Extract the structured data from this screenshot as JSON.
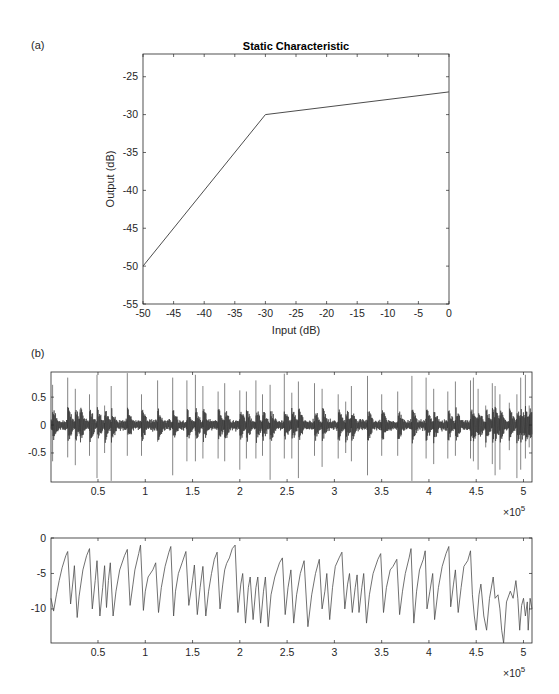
{
  "figure": {
    "panel_a_label": "(a)",
    "panel_b_label": "(b)",
    "axis_color": "#262626",
    "line_color": "#4d4d4d",
    "waveform_color": "#333333"
  },
  "chart_data": [
    {
      "id": "static-characteristic",
      "type": "line",
      "title": "Static Characteristic",
      "xlabel": "Input (dB)",
      "ylabel": "Output (dB)",
      "xlim": [
        -50,
        0
      ],
      "ylim": [
        -55,
        -22
      ],
      "xticks": [
        -50,
        -45,
        -40,
        -35,
        -30,
        -25,
        -20,
        -15,
        -10,
        -5,
        0
      ],
      "yticks": [
        -55,
        -50,
        -45,
        -40,
        -35,
        -30,
        -25
      ],
      "grid": false,
      "legend": null,
      "series": [
        {
          "name": "static characteristic",
          "x": [
            -50,
            -30,
            0
          ],
          "y": [
            -50,
            -30,
            -27
          ]
        }
      ],
      "annotations": [
        "knee at input -30 dB (slope 1 below, slope 0.1 above)"
      ]
    },
    {
      "id": "input-signal",
      "type": "line",
      "title": "",
      "xlabel": "",
      "ylabel": "",
      "x_multiplier": "×10^5",
      "xlim": [
        0.003,
        5.09
      ],
      "ylim": [
        -1.02,
        0.95
      ],
      "xticks": [
        0.5,
        1,
        1.5,
        2,
        2.5,
        3,
        3.5,
        4,
        4.5,
        5
      ],
      "yticks": [
        -0.5,
        0,
        0.5
      ],
      "grid": false,
      "description": "Percussive audio waveform, noise floor ~±0.1 with periodic transient spikes",
      "noise_amplitude": 0.1,
      "spikes": [
        {
          "x": 0.02,
          "up": 0.72,
          "down": -0.65
        },
        {
          "x": 0.18,
          "up": 0.85,
          "down": -0.58
        },
        {
          "x": 0.26,
          "up": 0.65,
          "down": -0.72
        },
        {
          "x": 0.31,
          "up": 0.28,
          "down": -0.2
        },
        {
          "x": 0.41,
          "up": 0.55,
          "down": -0.55
        },
        {
          "x": 0.49,
          "up": 0.9,
          "down": -0.95
        },
        {
          "x": 0.57,
          "up": 0.35,
          "down": -0.5
        },
        {
          "x": 0.64,
          "up": 0.7,
          "down": -1.0
        },
        {
          "x": 0.81,
          "up": 0.93,
          "down": -0.55
        },
        {
          "x": 0.96,
          "up": 0.55,
          "down": -0.55
        },
        {
          "x": 1.13,
          "up": 0.8,
          "down": -0.3
        },
        {
          "x": 1.29,
          "up": 0.85,
          "down": -0.9
        },
        {
          "x": 1.44,
          "up": 0.8,
          "down": -0.65
        },
        {
          "x": 1.53,
          "up": 0.9,
          "down": -0.65
        },
        {
          "x": 1.61,
          "up": 0.7,
          "down": -0.6
        },
        {
          "x": 1.77,
          "up": 0.6,
          "down": -0.6
        },
        {
          "x": 1.84,
          "up": 0.75,
          "down": -0.65
        },
        {
          "x": 2.0,
          "up": 0.62,
          "down": -0.8
        },
        {
          "x": 2.07,
          "up": 0.6,
          "down": -0.6
        },
        {
          "x": 2.17,
          "up": 0.8,
          "down": -0.6
        },
        {
          "x": 2.24,
          "up": 0.55,
          "down": -0.55
        },
        {
          "x": 2.32,
          "up": 0.72,
          "down": -0.98
        },
        {
          "x": 2.47,
          "up": 0.92,
          "down": -0.6
        },
        {
          "x": 2.55,
          "up": 0.58,
          "down": -0.6
        },
        {
          "x": 2.62,
          "up": 0.78,
          "down": -0.95
        },
        {
          "x": 2.79,
          "up": 0.75,
          "down": -0.55
        },
        {
          "x": 2.87,
          "up": 0.65,
          "down": -0.75
        },
        {
          "x": 3.04,
          "up": 0.55,
          "down": -0.6
        },
        {
          "x": 3.12,
          "up": 0.42,
          "down": -0.5
        },
        {
          "x": 3.18,
          "up": 0.7,
          "down": -0.65
        },
        {
          "x": 3.35,
          "up": 0.88,
          "down": -0.9
        },
        {
          "x": 3.5,
          "up": 0.55,
          "down": -0.55
        },
        {
          "x": 3.67,
          "up": 0.6,
          "down": -0.55
        },
        {
          "x": 3.82,
          "up": 0.88,
          "down": -1.0
        },
        {
          "x": 3.97,
          "up": 0.85,
          "down": -0.6
        },
        {
          "x": 4.05,
          "up": 0.65,
          "down": -0.7
        },
        {
          "x": 4.2,
          "up": 0.6,
          "down": -0.6
        },
        {
          "x": 4.28,
          "up": 0.78,
          "down": -0.55
        },
        {
          "x": 4.44,
          "up": 0.8,
          "down": -0.6
        },
        {
          "x": 4.47,
          "up": 0.85,
          "down": -0.65
        },
        {
          "x": 4.52,
          "up": 0.65,
          "down": -0.8
        },
        {
          "x": 4.6,
          "up": 0.35,
          "down": -0.4
        },
        {
          "x": 4.67,
          "up": 0.75,
          "down": -0.7
        },
        {
          "x": 4.7,
          "up": 0.7,
          "down": -0.9
        },
        {
          "x": 4.75,
          "up": 0.55,
          "down": -0.8
        },
        {
          "x": 4.85,
          "up": 0.4,
          "down": -0.45
        },
        {
          "x": 4.93,
          "up": 0.55,
          "down": -0.95
        },
        {
          "x": 4.97,
          "up": 0.85,
          "down": -0.8
        },
        {
          "x": 5.02,
          "up": 0.9,
          "down": -0.6
        },
        {
          "x": 5.06,
          "up": 0.35,
          "down": -0.4
        }
      ]
    },
    {
      "id": "gain-signal",
      "type": "line",
      "title": "",
      "xlabel": "",
      "ylabel": "",
      "x_multiplier": "×10^5",
      "xlim": [
        0.003,
        5.09
      ],
      "ylim": [
        -14.8,
        0
      ],
      "xticks": [
        0.5,
        1,
        1.5,
        2,
        2.5,
        3,
        3.5,
        4,
        4.5,
        5
      ],
      "yticks": [
        -10,
        -5,
        0
      ],
      "grid": false,
      "description": "Sawtooth-like gain trace: sharp drops at transients then gradual recovery",
      "points": [
        [
          0.003,
          -8.5
        ],
        [
          0.03,
          -10.3
        ],
        [
          0.06,
          -8
        ],
        [
          0.09,
          -6
        ],
        [
          0.12,
          -4.2
        ],
        [
          0.16,
          -2.5
        ],
        [
          0.18,
          -1.9
        ],
        [
          0.21,
          -9.3
        ],
        [
          0.24,
          -5.5
        ],
        [
          0.25,
          -3.9
        ],
        [
          0.28,
          -11.2
        ],
        [
          0.3,
          -8.2
        ],
        [
          0.34,
          -4.5
        ],
        [
          0.38,
          -2.5
        ],
        [
          0.41,
          -1.5
        ],
        [
          0.44,
          -10
        ],
        [
          0.47,
          -6
        ],
        [
          0.49,
          -3.2
        ],
        [
          0.52,
          -11
        ],
        [
          0.55,
          -7
        ],
        [
          0.57,
          -3.9
        ],
        [
          0.59,
          -9.8
        ],
        [
          0.61,
          -6
        ],
        [
          0.63,
          -3.5
        ],
        [
          0.66,
          -11
        ],
        [
          0.69,
          -7.5
        ],
        [
          0.73,
          -4.5
        ],
        [
          0.78,
          -2.5
        ],
        [
          0.81,
          -1.6
        ],
        [
          0.84,
          -9.5
        ],
        [
          0.87,
          -6.5
        ],
        [
          0.89,
          -4.5
        ],
        [
          0.93,
          -2.2
        ],
        [
          0.95,
          -1
        ],
        [
          0.98,
          -10.2
        ],
        [
          1.0,
          -7.5
        ],
        [
          1.03,
          -5.5
        ],
        [
          1.08,
          -4.5
        ],
        [
          1.11,
          -3.5
        ],
        [
          1.14,
          -10.5
        ],
        [
          1.17,
          -7
        ],
        [
          1.21,
          -4
        ],
        [
          1.25,
          -2
        ],
        [
          1.27,
          -1.2
        ],
        [
          1.3,
          -11
        ],
        [
          1.32,
          -7.5
        ],
        [
          1.35,
          -5
        ],
        [
          1.39,
          -3.5
        ],
        [
          1.43,
          -1.9
        ],
        [
          1.46,
          -9.5
        ],
        [
          1.5,
          -6
        ],
        [
          1.52,
          -3.8
        ],
        [
          1.55,
          -10.8
        ],
        [
          1.58,
          -7
        ],
        [
          1.61,
          -4
        ],
        [
          1.64,
          -11
        ],
        [
          1.67,
          -7.5
        ],
        [
          1.7,
          -5
        ],
        [
          1.73,
          -3
        ],
        [
          1.76,
          -2
        ],
        [
          1.79,
          -10
        ],
        [
          1.82,
          -6.5
        ],
        [
          1.84,
          -4.5
        ],
        [
          1.86,
          -3.6
        ],
        [
          1.89,
          -2.8
        ],
        [
          1.92,
          -1.5
        ],
        [
          1.95,
          -1
        ],
        [
          1.98,
          -10.5
        ],
        [
          2.01,
          -6.5
        ],
        [
          2.03,
          -5
        ],
        [
          2.06,
          -12
        ],
        [
          2.09,
          -7
        ],
        [
          2.11,
          -5.5
        ],
        [
          2.14,
          -11.5
        ],
        [
          2.17,
          -7
        ],
        [
          2.19,
          -5.5
        ],
        [
          2.22,
          -12
        ],
        [
          2.25,
          -7.5
        ],
        [
          2.27,
          -5.5
        ],
        [
          2.3,
          -12.5
        ],
        [
          2.33,
          -8
        ],
        [
          2.37,
          -5.5
        ],
        [
          2.42,
          -3.5
        ],
        [
          2.45,
          -2.8
        ],
        [
          2.48,
          -10.8
        ],
        [
          2.51,
          -7
        ],
        [
          2.54,
          -4.5
        ],
        [
          2.57,
          -12
        ],
        [
          2.6,
          -8
        ],
        [
          2.64,
          -5
        ],
        [
          2.68,
          -3.2
        ],
        [
          2.72,
          -12.5
        ],
        [
          2.76,
          -8
        ],
        [
          2.8,
          -5
        ],
        [
          2.84,
          -3
        ],
        [
          2.87,
          -10
        ],
        [
          2.9,
          -7.5
        ],
        [
          2.92,
          -5
        ],
        [
          2.95,
          -11.5
        ],
        [
          2.98,
          -7
        ],
        [
          3.01,
          -4
        ],
        [
          3.05,
          -2.8
        ],
        [
          3.08,
          -2
        ],
        [
          3.11,
          -10
        ],
        [
          3.14,
          -6.5
        ],
        [
          3.16,
          -5
        ],
        [
          3.19,
          -10.5
        ],
        [
          3.22,
          -7
        ],
        [
          3.24,
          -5.2
        ],
        [
          3.26,
          -10.5
        ],
        [
          3.29,
          -7
        ],
        [
          3.31,
          -5
        ],
        [
          3.34,
          -12
        ],
        [
          3.37,
          -8
        ],
        [
          3.41,
          -5
        ],
        [
          3.46,
          -3
        ],
        [
          3.49,
          -2.2
        ],
        [
          3.52,
          -10.5
        ],
        [
          3.55,
          -7
        ],
        [
          3.59,
          -4.5
        ],
        [
          3.62,
          -4
        ],
        [
          3.66,
          -3
        ],
        [
          3.69,
          -10.8
        ],
        [
          3.72,
          -7.5
        ],
        [
          3.75,
          -5
        ],
        [
          3.79,
          -2.8
        ],
        [
          3.81,
          -1.5
        ],
        [
          3.84,
          -12
        ],
        [
          3.87,
          -7.5
        ],
        [
          3.9,
          -4.5
        ],
        [
          3.94,
          -3
        ],
        [
          3.96,
          -1.8
        ],
        [
          3.98,
          -10
        ],
        [
          4.01,
          -7.5
        ],
        [
          4.04,
          -5
        ],
        [
          4.06,
          -11.5
        ],
        [
          4.1,
          -7
        ],
        [
          4.14,
          -4
        ],
        [
          4.18,
          -2.2
        ],
        [
          4.21,
          -1.2
        ],
        [
          4.23,
          -9.7
        ],
        [
          4.26,
          -6.5
        ],
        [
          4.28,
          -4.5
        ],
        [
          4.31,
          -10.5
        ],
        [
          4.34,
          -7
        ],
        [
          4.37,
          -4
        ],
        [
          4.41,
          -3.2
        ],
        [
          4.44,
          -1.8
        ],
        [
          4.46,
          -8
        ],
        [
          4.48,
          -11
        ],
        [
          4.5,
          -13
        ],
        [
          4.53,
          -8
        ],
        [
          4.55,
          -6.5
        ],
        [
          4.58,
          -11
        ],
        [
          4.61,
          -13
        ],
        [
          4.64,
          -8.5
        ],
        [
          4.68,
          -5.5
        ],
        [
          4.7,
          -8.5
        ],
        [
          4.73,
          -8
        ],
        [
          4.75,
          -10
        ],
        [
          4.77,
          -13
        ],
        [
          4.79,
          -14.8
        ],
        [
          4.82,
          -9
        ],
        [
          4.86,
          -7.5
        ],
        [
          4.89,
          -8.5
        ],
        [
          4.92,
          -6
        ],
        [
          4.94,
          -8.5
        ],
        [
          4.96,
          -13
        ],
        [
          4.98,
          -9.5
        ],
        [
          5.0,
          -8.5
        ],
        [
          5.02,
          -11
        ],
        [
          5.04,
          -9
        ],
        [
          5.05,
          -13
        ],
        [
          5.07,
          -8.5
        ],
        [
          5.09,
          -10
        ]
      ]
    }
  ]
}
